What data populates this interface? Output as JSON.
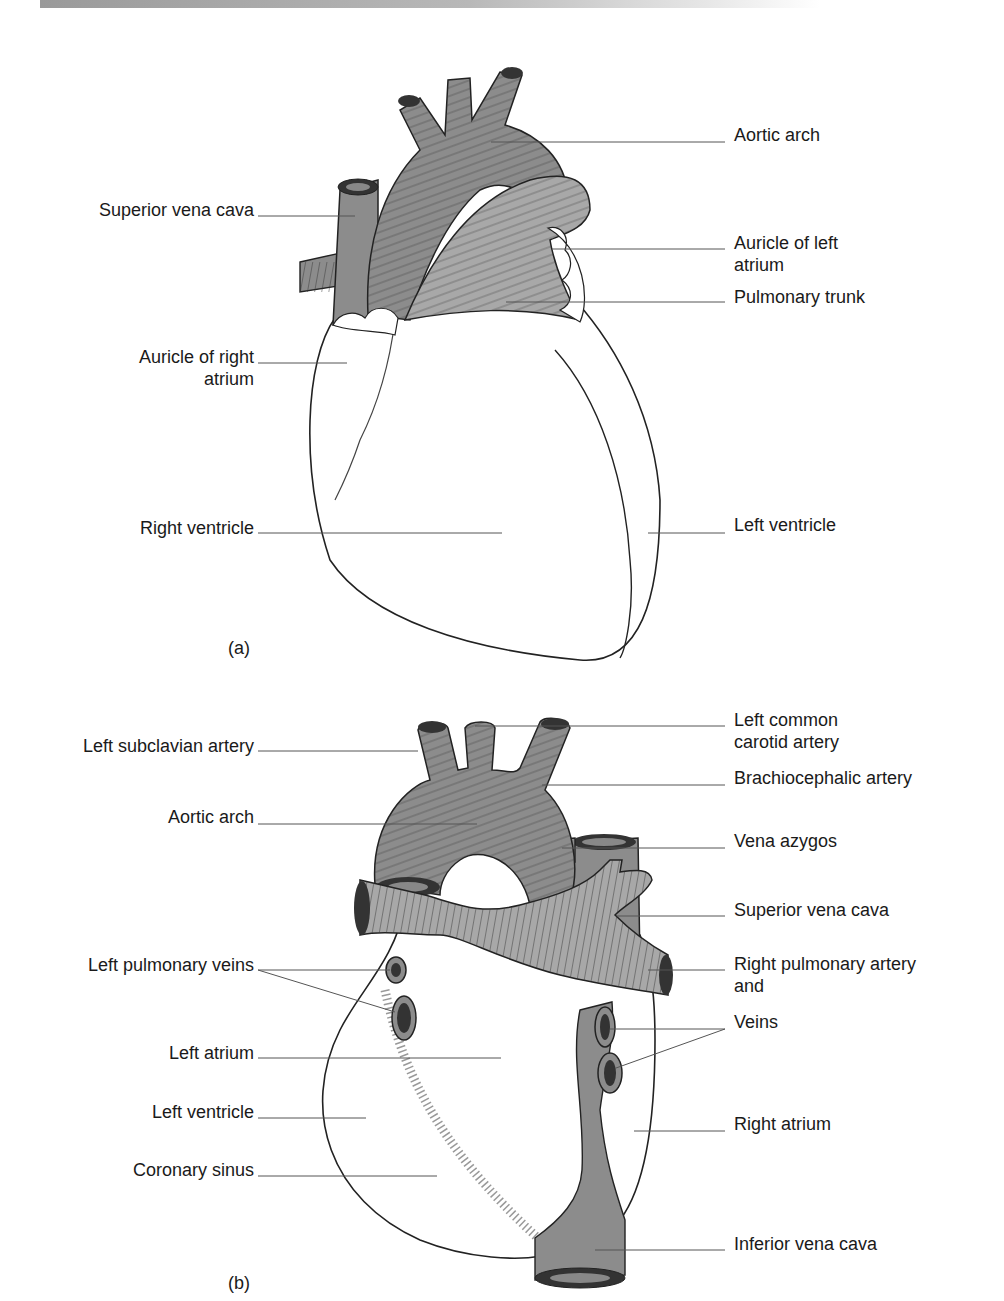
{
  "figure_a": {
    "caption": "(a)",
    "labels": {
      "aortic_arch": "Aortic arch",
      "superior_vena_cava": "Superior vena cava",
      "auricle_left_atrium_1": "Auricle of left",
      "auricle_left_atrium_2": "atrium",
      "pulmonary_trunk": "Pulmonary trunk",
      "auricle_right_atrium_1": "Auricle of right",
      "auricle_right_atrium_2": "atrium",
      "right_ventricle": "Right ventricle",
      "left_ventricle": "Left ventricle"
    }
  },
  "figure_b": {
    "caption": "(b)",
    "labels": {
      "left_common_carotid_1": "Left common",
      "left_common_carotid_2": "carotid artery",
      "left_subclavian": "Left subclavian artery",
      "brachiocephalic": "Brachiocephalic artery",
      "aortic_arch": "Aortic arch",
      "vena_azygos": "Vena azygos",
      "superior_vena_cava": "Superior vena cava",
      "left_pulmonary_veins": "Left pulmonary veins",
      "right_pulmonary_artery_1": "Right pulmonary artery",
      "right_pulmonary_artery_2": "and",
      "veins": "Veins",
      "left_atrium": "Left atrium",
      "left_ventricle": "Left ventricle",
      "right_atrium": "Right atrium",
      "coronary_sinus": "Coronary sinus",
      "inferior_vena_cava": "Inferior vena cava"
    }
  },
  "colors": {
    "vessel_dark": "#8c8c8c",
    "vessel_light": "#a8a8a8",
    "outline": "#222222",
    "leader": "#555555"
  }
}
